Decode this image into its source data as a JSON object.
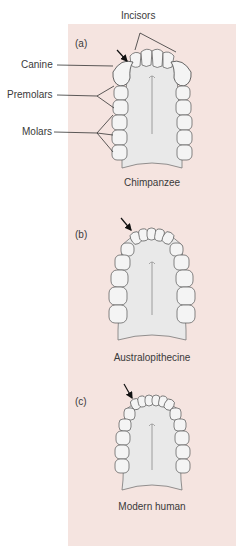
{
  "figure": {
    "background_color": "#f5e4e0",
    "panels": [
      {
        "id": "a",
        "sub_label": "(a)",
        "caption": "Chimpanzee",
        "annotations": [
          "Incisors",
          "Canine",
          "Premolars",
          "Molars"
        ],
        "arrow_target": "canine-incisor diastema"
      },
      {
        "id": "b",
        "sub_label": "(b)",
        "caption": "Australopithecine",
        "arrow_target": "canine"
      },
      {
        "id": "c",
        "sub_label": "(c)",
        "caption": "Modern human",
        "arrow_target": "canine"
      }
    ],
    "labels": {
      "incisors": "Incisors",
      "canine": "Canine",
      "premolars": "Premolars",
      "molars": "Molars"
    }
  }
}
